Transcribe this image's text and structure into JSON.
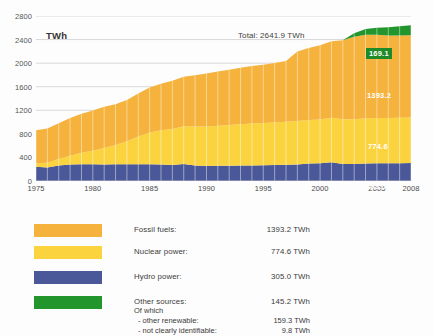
{
  "chart": {
    "unit_label": "TWh",
    "total_label": "Total: 2641.9 TWh",
    "value_labels": {
      "other": "169.1",
      "fossil": "1393.2",
      "nuclear": "774.6",
      "hydro": "305.0"
    }
  },
  "legend": {
    "rows": [
      {
        "name": "Fossil fuels:",
        "value": "1393.2 TWh",
        "color": "#F5B23C"
      },
      {
        "name": "Nuclear power:",
        "value": "774.6 TWh",
        "color": "#FAD33F"
      },
      {
        "name": "Hydro power:",
        "value": "305.0 TWh",
        "color": "#4A5899"
      },
      {
        "name": "Other sources:",
        "value": "145.2 TWh",
        "color": "#22962C"
      }
    ],
    "of_which_label": "Of which",
    "sub_rows": [
      {
        "name": "- other renewable:",
        "value": "159.3 TWh"
      },
      {
        "name": "- not clearly identifiable:",
        "value": "9.8 TWh"
      }
    ]
  },
  "chart_data": {
    "type": "area",
    "title": "",
    "subtitle": "Total: 2641.9 TWh",
    "xlabel": "",
    "ylabel": "TWh",
    "ylim": [
      0,
      2800
    ],
    "yticks": [
      0,
      400,
      800,
      1200,
      1600,
      2000,
      2400,
      2800
    ],
    "xticks": [
      1975,
      1980,
      1985,
      1990,
      1995,
      2000,
      2005,
      2008
    ],
    "xlim": [
      1975,
      2008
    ],
    "grid": true,
    "stacked": true,
    "legend_position": "below",
    "x": [
      1975,
      1976,
      1977,
      1978,
      1979,
      1980,
      1981,
      1982,
      1983,
      1984,
      1985,
      1986,
      1987,
      1988,
      1989,
      1990,
      1991,
      1992,
      1993,
      1994,
      1995,
      1996,
      1997,
      1998,
      1999,
      2000,
      2001,
      2002,
      2003,
      2004,
      2005,
      2006,
      2007,
      2008
    ],
    "series": [
      {
        "name": "Hydro power",
        "color": "#4A5899",
        "end_value": 305.0,
        "values": [
          243,
          230,
          262,
          280,
          285,
          285,
          278,
          283,
          285,
          285,
          285,
          280,
          272,
          290,
          265,
          255,
          258,
          260,
          262,
          265,
          268,
          272,
          275,
          282,
          295,
          300,
          320,
          290,
          288,
          298,
          302,
          300,
          303,
          305
        ]
      },
      {
        "name": "Nuclear power",
        "color": "#FAD33F",
        "end_value": 774.6,
        "values": [
          60,
          80,
          110,
          150,
          195,
          230,
          280,
          330,
          390,
          470,
          540,
          580,
          610,
          640,
          660,
          670,
          680,
          690,
          700,
          710,
          715,
          722,
          730,
          735,
          740,
          745,
          752,
          758,
          760,
          765,
          768,
          770,
          772,
          774.6
        ]
      },
      {
        "name": "Fossil fuels",
        "color": "#F5B23C",
        "end_value": 1393.2,
        "values": [
          560,
          580,
          610,
          640,
          660,
          680,
          700,
          690,
          700,
          730,
          760,
          790,
          820,
          840,
          870,
          900,
          920,
          940,
          960,
          975,
          990,
          1010,
          1030,
          1180,
          1220,
          1260,
          1300,
          1340,
          1400,
          1420,
          1410,
          1400,
          1395,
          1393.2
        ]
      },
      {
        "name": "Other sources",
        "color": "#22962C",
        "end_value": 169.1,
        "values": [
          0,
          0,
          0,
          0,
          0,
          0,
          0,
          0,
          0,
          0,
          0,
          0,
          0,
          0,
          0,
          0,
          0,
          0,
          0,
          0,
          0,
          0,
          0,
          0,
          0,
          0,
          0,
          0,
          60,
          95,
          120,
          140,
          158,
          169.1
        ]
      }
    ],
    "totals": [
      863,
      890,
      982,
      1070,
      1140,
      1195,
      1258,
      1303,
      1375,
      1485,
      1585,
      1650,
      1702,
      1770,
      1795,
      1825,
      1858,
      1890,
      1922,
      1950,
      1973,
      2004,
      2035,
      2197,
      2255,
      2305,
      2372,
      2388,
      2508,
      2578,
      2600,
      2610,
      2628,
      2641.9
    ]
  }
}
